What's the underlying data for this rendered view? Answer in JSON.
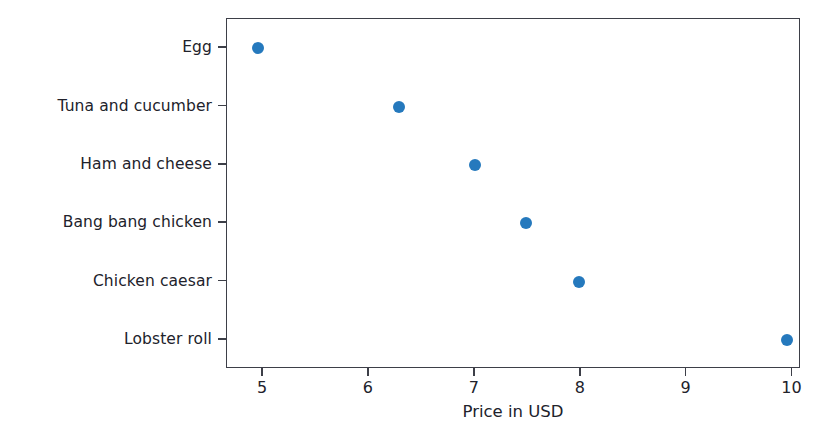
{
  "chart_data": {
    "type": "scatter",
    "title": "",
    "xlabel": "Price in USD",
    "ylabel": "",
    "orientation": "horizontal",
    "grid": false,
    "legend": false,
    "marker_color": "#1f77b4",
    "xlim": [
      4.66,
      10.08
    ],
    "xticks": [
      "5",
      "6",
      "7",
      "8",
      "9",
      "10"
    ],
    "xtick_values": [
      5,
      6,
      7,
      8,
      9,
      10
    ],
    "categories": [
      "Egg",
      "Tuna and cucumber",
      "Ham and cheese",
      "Bang bang chicken",
      "Chicken caesar",
      "Lobster roll"
    ],
    "values": [
      4.95,
      6.28,
      7.0,
      7.48,
      7.98,
      9.95
    ],
    "points": [
      {
        "label": "Egg",
        "value": 4.95
      },
      {
        "label": "Tuna and cucumber",
        "value": 6.28
      },
      {
        "label": "Ham and cheese",
        "value": 7.0
      },
      {
        "label": "Bang bang chicken",
        "value": 7.48
      },
      {
        "label": "Chicken caesar",
        "value": 7.98
      },
      {
        "label": "Lobster roll",
        "value": 9.95
      }
    ]
  }
}
